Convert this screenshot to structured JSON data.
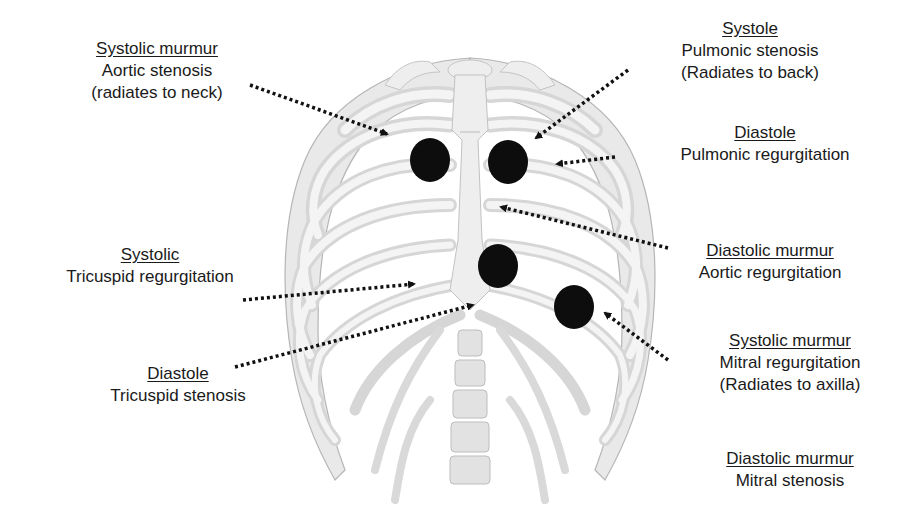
{
  "diagram": {
    "dot_color": "#0d0d0d",
    "arrow_color": "#111111"
  },
  "labels": {
    "aortic_stenosis": {
      "head": "Systolic murmur",
      "lines": [
        "Aortic stenosis",
        "(radiates to neck)"
      ]
    },
    "pulmonic_stenosis": {
      "head": "Systole",
      "lines": [
        "Pulmonic stenosis",
        "(Radiates to back)"
      ]
    },
    "pulmonic_regurgitation": {
      "head": "Diastole",
      "lines": [
        "Pulmonic regurgitation"
      ]
    },
    "tricuspid_regurgitation": {
      "head": "Systolic",
      "lines": [
        "Tricuspid regurgitation"
      ]
    },
    "aortic_regurgitation": {
      "head": "Diastolic murmur",
      "lines": [
        "Aortic regurgitation"
      ]
    },
    "tricuspid_stenosis": {
      "head": "Diastole",
      "lines": [
        "Tricuspid stenosis"
      ]
    },
    "mitral_regurgitation": {
      "head": "Systolic murmur",
      "lines": [
        "Mitral regurgitation",
        "(Radiates to axilla)"
      ]
    },
    "mitral_stenosis": {
      "head": "Diastolic murmur",
      "lines": [
        "Mitral stenosis"
      ]
    }
  },
  "auscultation_points": [
    {
      "name": "aortic-area",
      "cx": 430,
      "cy": 160
    },
    {
      "name": "pulmonic-area",
      "cx": 508,
      "cy": 162
    },
    {
      "name": "tricuspid-area",
      "cx": 498,
      "cy": 266
    },
    {
      "name": "mitral-area",
      "cx": 574,
      "cy": 307
    }
  ]
}
